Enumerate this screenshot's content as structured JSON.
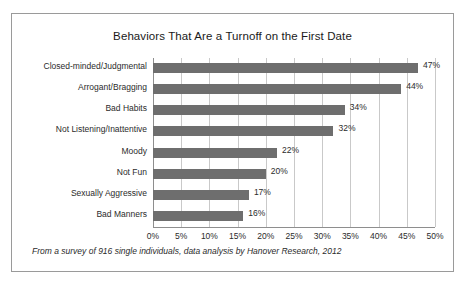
{
  "chart_data": {
    "type": "bar",
    "orientation": "horizontal",
    "title": "Behaviors That Are a Turnoff on the First Date",
    "xlabel": "",
    "ylabel": "",
    "xlim": [
      0,
      50
    ],
    "xtick_labels": [
      "0%",
      "5%",
      "10%",
      "15%",
      "20%",
      "25%",
      "30%",
      "35%",
      "40%",
      "45%",
      "50%"
    ],
    "xticks": [
      0,
      5,
      10,
      15,
      20,
      25,
      30,
      35,
      40,
      45,
      50
    ],
    "grid": "vertical",
    "legend": "none",
    "categories": [
      "Closed-minded/Judgmental",
      "Arrogant/Bragging",
      "Bad Habits",
      "Not Listening/Inattentive",
      "Moody",
      "Not Fun",
      "Sexually Aggressive",
      "Bad Manners"
    ],
    "values": [
      47,
      44,
      34,
      32,
      22,
      20,
      17,
      16
    ],
    "data_labels": [
      "47%",
      "44%",
      "34%",
      "32%",
      "22%",
      "20%",
      "17%",
      "16%"
    ],
    "bar_color": "#6e6e6e",
    "grid_color": "#c9c9c9",
    "axis_color": "#8e8e8e"
  },
  "footnote": "From a survey of 916 single individuals, data analysis by Hanover Research, 2012"
}
